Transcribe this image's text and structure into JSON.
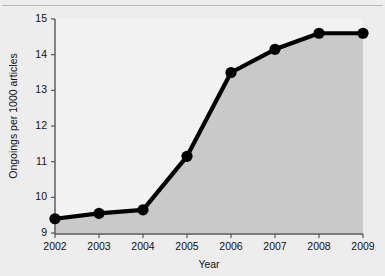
{
  "figure": {
    "caption_remnant": "",
    "background_color": "#ededed",
    "plot_background_color": "#f2f2f2"
  },
  "chart_data": {
    "type": "area",
    "title": "",
    "subtitle": "",
    "xlabel": "Year",
    "ylabel": "Ongoings per 1000 articles",
    "categories": [
      "2002",
      "2003",
      "2004",
      "2005",
      "2006",
      "2007",
      "2008",
      "2009"
    ],
    "x": [
      2002,
      2003,
      2004,
      2005,
      2006,
      2007,
      2008,
      2009
    ],
    "values": [
      9.4,
      9.55,
      9.65,
      11.15,
      13.5,
      14.15,
      14.6,
      14.6
    ],
    "series": [
      {
        "name": "Ongoings per 1000 articles",
        "values": [
          9.4,
          9.55,
          9.65,
          11.15,
          13.5,
          14.15,
          14.6,
          14.6
        ]
      }
    ],
    "xlim": [
      2002,
      2009
    ],
    "ylim": [
      9,
      15
    ],
    "ytick_labels": [
      "9",
      "10",
      "11",
      "12",
      "13",
      "14",
      "15"
    ],
    "yticks": [
      9,
      10,
      11,
      12,
      13,
      14,
      15
    ],
    "xtick_labels": [
      "2002",
      "2003",
      "2004",
      "2005",
      "2006",
      "2007",
      "2008",
      "2009"
    ],
    "grid": false,
    "legend": "none",
    "marker": "filled-circle",
    "line_color": "#000000",
    "marker_color": "#000000",
    "fill_color": "#c9c9c9",
    "axis_color": "#555555"
  }
}
